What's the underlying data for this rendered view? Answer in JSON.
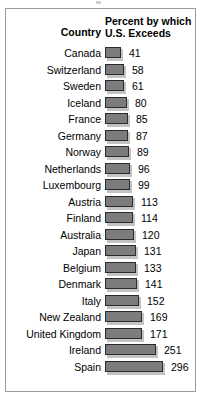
{
  "figure": {
    "header": {
      "country_label": "Country",
      "measure_line1": "Percent by which",
      "measure_line2": "U.S. Exceeds"
    },
    "style": {
      "bar_fill": "#7c7c7c",
      "bar_outline": "#2b2b2b",
      "bar_shadow": "#c3c3c3",
      "frame_border": "#9a9a9a",
      "text_color": "#000000",
      "background": "#ffffff"
    }
  },
  "chart_data": {
    "type": "bar",
    "orientation": "horizontal",
    "title": "",
    "subtitle": "",
    "xlabel": "Percent by which U.S. Exceeds",
    "ylabel": "Country",
    "grid": false,
    "legend": null,
    "xlim": [
      0,
      296
    ],
    "value_labels_shown": true,
    "categories": [
      "Canada",
      "Switzerland",
      "Sweden",
      "Iceland",
      "France",
      "Germany",
      "Norway",
      "Netherlands",
      "Luxembourg",
      "Austria",
      "Finland",
      "Australia",
      "Japan",
      "Belgium",
      "Denmark",
      "Italy",
      "New Zealand",
      "United Kingdom",
      "Ireland",
      "Spain"
    ],
    "values": [
      41,
      58,
      61,
      80,
      85,
      87,
      89,
      96,
      99,
      113,
      114,
      120,
      131,
      133,
      141,
      152,
      169,
      171,
      251,
      296
    ],
    "rows": [
      {
        "country": "Canada",
        "value": 41,
        "value_text": "41"
      },
      {
        "country": "Switzerland",
        "value": 58,
        "value_text": "58"
      },
      {
        "country": "Sweden",
        "value": 61,
        "value_text": "61"
      },
      {
        "country": "Iceland",
        "value": 80,
        "value_text": "80"
      },
      {
        "country": "France",
        "value": 85,
        "value_text": "85"
      },
      {
        "country": "Germany",
        "value": 87,
        "value_text": "87"
      },
      {
        "country": "Norway",
        "value": 89,
        "value_text": "89"
      },
      {
        "country": "Netherlands",
        "value": 96,
        "value_text": "96"
      },
      {
        "country": "Luxembourg",
        "value": 99,
        "value_text": "99"
      },
      {
        "country": "Austria",
        "value": 113,
        "value_text": "113"
      },
      {
        "country": "Finland",
        "value": 114,
        "value_text": "114"
      },
      {
        "country": "Australia",
        "value": 120,
        "value_text": "120"
      },
      {
        "country": "Japan",
        "value": 131,
        "value_text": "131"
      },
      {
        "country": "Belgium",
        "value": 133,
        "value_text": "133"
      },
      {
        "country": "Denmark",
        "value": 141,
        "value_text": "141"
      },
      {
        "country": "Italy",
        "value": 152,
        "value_text": "152"
      },
      {
        "country": "New Zealand",
        "value": 169,
        "value_text": "169"
      },
      {
        "country": "United Kingdom",
        "value": 171,
        "value_text": "171"
      },
      {
        "country": "Ireland",
        "value": 251,
        "value_text": "251"
      },
      {
        "country": "Spain",
        "value": 296,
        "value_text": "296"
      }
    ]
  }
}
